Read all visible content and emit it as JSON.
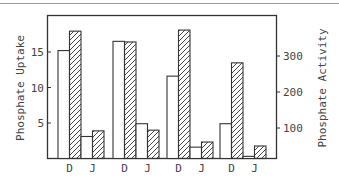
{
  "chart_data": {
    "type": "bar",
    "title": "",
    "xlabel": "",
    "ylabel": "Phosphate Uptake",
    "y2label": "Phosphate Activity",
    "categories": [
      "D",
      "J",
      "D",
      "J",
      "D",
      "J",
      "D",
      "J"
    ],
    "groups": 4,
    "series": [
      {
        "name": "Phosphate Uptake",
        "style": "open",
        "axis": "left",
        "values": [
          15.2,
          3.1,
          16.5,
          4.9,
          11.6,
          1.6,
          4.9,
          0.3
        ]
      },
      {
        "name": "Phosphate Activity",
        "style": "hatched",
        "axis": "right",
        "values": [
          369,
          92,
          339,
          94,
          372,
          61,
          281,
          50
        ]
      }
    ],
    "yticks": [
      "5",
      "10",
      "15"
    ],
    "y2ticks": [
      "100",
      "200",
      "300"
    ],
    "ylim": [
      0,
      20
    ],
    "y2lim": [
      0,
      450
    ],
    "grid": false,
    "legend": "none"
  }
}
